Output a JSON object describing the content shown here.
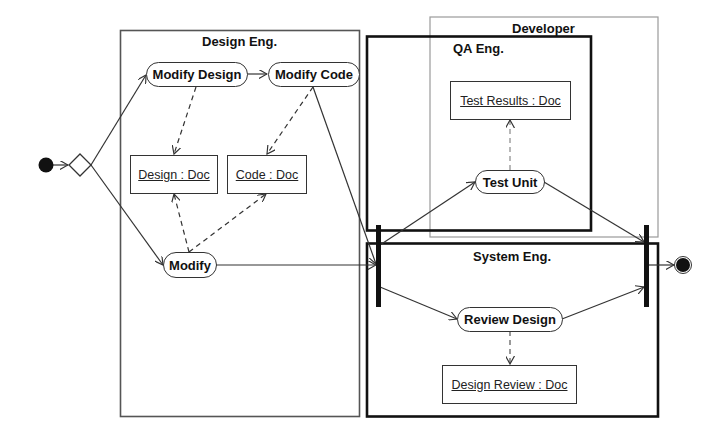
{
  "diagram": {
    "type": "UML activity diagram",
    "swimlanes": [
      {
        "id": "design-eng",
        "label": "Design Eng."
      },
      {
        "id": "developer",
        "label": "Developer"
      },
      {
        "id": "qa-eng",
        "label": "QA Eng."
      },
      {
        "id": "system-eng",
        "label": "System Eng."
      }
    ],
    "actions": [
      {
        "id": "modify-design",
        "label": "Modify Design"
      },
      {
        "id": "modify-code",
        "label": "Modify Code"
      },
      {
        "id": "modify",
        "label": "Modify"
      },
      {
        "id": "test-unit",
        "label": "Test Unit"
      },
      {
        "id": "review-design",
        "label": "Review Design"
      }
    ],
    "objects": [
      {
        "id": "design-doc",
        "label": "Design : Doc"
      },
      {
        "id": "code-doc",
        "label": "Code : Doc"
      },
      {
        "id": "test-results-doc",
        "label": "Test Results : Doc"
      },
      {
        "id": "design-review-doc",
        "label": "Design Review : Doc"
      }
    ],
    "control_nodes": [
      "initial",
      "decision",
      "fork",
      "join",
      "final"
    ],
    "flows": [
      {
        "from": "initial",
        "to": "decision",
        "kind": "control"
      },
      {
        "from": "decision",
        "to": "modify-design",
        "kind": "control"
      },
      {
        "from": "decision",
        "to": "modify",
        "kind": "control"
      },
      {
        "from": "modify-design",
        "to": "modify-code",
        "kind": "control"
      },
      {
        "from": "modify-code",
        "to": "fork",
        "kind": "control"
      },
      {
        "from": "modify",
        "to": "fork",
        "kind": "control"
      },
      {
        "from": "fork",
        "to": "test-unit",
        "kind": "control"
      },
      {
        "from": "fork",
        "to": "review-design",
        "kind": "control"
      },
      {
        "from": "test-unit",
        "to": "join",
        "kind": "control"
      },
      {
        "from": "review-design",
        "to": "join",
        "kind": "control"
      },
      {
        "from": "join",
        "to": "final",
        "kind": "control"
      },
      {
        "from": "modify-design",
        "to": "design-doc",
        "kind": "object"
      },
      {
        "from": "modify-code",
        "to": "code-doc",
        "kind": "object"
      },
      {
        "from": "modify",
        "to": "design-doc",
        "kind": "object"
      },
      {
        "from": "modify",
        "to": "code-doc",
        "kind": "object"
      },
      {
        "from": "test-unit",
        "to": "test-results-doc",
        "kind": "object"
      },
      {
        "from": "review-design",
        "to": "design-review-doc",
        "kind": "object"
      }
    ],
    "colors": {
      "line": "#333333",
      "thick_border": "#111111",
      "design_lane_border": "#555555",
      "developer_lane_border": "#9a9a9a",
      "node_fill": "#111111",
      "background": "#ffffff"
    }
  }
}
